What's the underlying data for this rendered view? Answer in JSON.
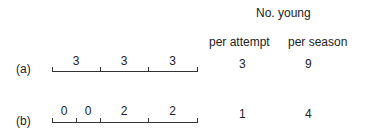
{
  "header": {
    "title": "No. young",
    "col1": "per attempt",
    "col2": "per season"
  },
  "rows": [
    {
      "label": "(a)",
      "segments": [
        {
          "value": "3",
          "from": 0,
          "to": 1
        },
        {
          "value": "3",
          "from": 1,
          "to": 2
        },
        {
          "value": "3",
          "from": 2,
          "to": 3
        }
      ],
      "per_attempt": "3",
      "per_season": "9"
    },
    {
      "label": "(b)",
      "segments": [
        {
          "value": "0",
          "from": 0,
          "to": 0.5
        },
        {
          "value": "0",
          "from": 0.5,
          "to": 1
        },
        {
          "value": "2",
          "from": 1,
          "to": 2
        },
        {
          "value": "2",
          "from": 2,
          "to": 3
        }
      ],
      "per_attempt": "1",
      "per_season": "4"
    }
  ]
}
